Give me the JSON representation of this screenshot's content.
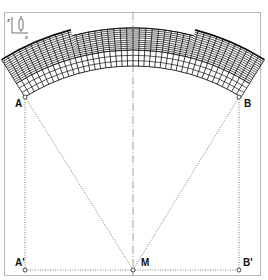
{
  "diagram": {
    "type": "arched segmented structure with projection construction",
    "axes_icon": {
      "vertical_label": "z",
      "horizontal_label": "x"
    },
    "points": [
      {
        "id": "A",
        "label": "A",
        "x": 25,
        "y": 97
      },
      {
        "id": "B",
        "label": "B",
        "x": 239,
        "y": 97
      },
      {
        "id": "A'",
        "label": "A'",
        "x": 25,
        "y": 270
      },
      {
        "id": "M",
        "label": "M",
        "x": 133,
        "y": 270
      },
      {
        "id": "B'",
        "label": "B'",
        "x": 239,
        "y": 270
      }
    ],
    "arch": {
      "center": {
        "x": 133,
        "y": 270
      },
      "inner_radius": 204,
      "outer_radius_middle": 242,
      "outer_radius_sides": 248,
      "step_angle_deg": 14.5,
      "half_angle_deg": 32,
      "spoke_count": 42,
      "ring_count_dense": 11,
      "ring_count_sparse": 3
    },
    "colors": {
      "line": "#111111",
      "construction_line": "#555555",
      "frame": "#b8b8b8",
      "centerline": "#777777"
    }
  }
}
